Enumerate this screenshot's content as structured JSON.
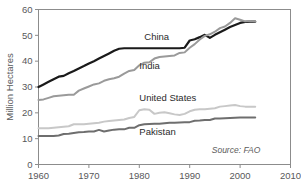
{
  "chart_data": {
    "type": "line",
    "title": "",
    "subtitle": "",
    "xlabel": "",
    "ylabel": "Million Hectares",
    "xlim": [
      1960,
      2010
    ],
    "ylim": [
      0,
      60
    ],
    "xticks": [
      1960,
      1970,
      1980,
      1990,
      2000,
      2010
    ],
    "xticklabels": [
      "1960",
      "1970",
      "1980",
      "1990",
      "2000",
      "2010"
    ],
    "yticks": [
      0,
      10,
      20,
      30,
      40,
      50,
      60
    ],
    "yticklabels": [
      "0",
      "10",
      "20",
      "30",
      "40",
      "50",
      "60"
    ],
    "grid": false,
    "legend_position": "inline-labels",
    "annotations": [
      {
        "name": "source",
        "text": "Source: FAO",
        "x": 2004,
        "y": 4.4
      }
    ],
    "series": [
      {
        "name": "China",
        "label": "China",
        "color": "#1a1a1a",
        "width": 2.2,
        "label_x": 1981,
        "label_y": 48.2,
        "x": [
          1960,
          1961,
          1962,
          1963,
          1964,
          1965,
          1966,
          1967,
          1968,
          1969,
          1970,
          1971,
          1972,
          1973,
          1974,
          1975,
          1976,
          1977,
          1978,
          1979,
          1980,
          1981,
          1982,
          1983,
          1984,
          1985,
          1986,
          1987,
          1988,
          1989,
          1990,
          1991,
          1992,
          1993,
          1994,
          1995,
          1996,
          1997,
          1998,
          1999,
          2000,
          2001,
          2002,
          2003
        ],
        "y": [
          30.0,
          31.0,
          32.0,
          33.0,
          34.0,
          34.3,
          35.3,
          36.2,
          37.2,
          38.1,
          39.1,
          40.0,
          41.0,
          42.0,
          43.0,
          44.0,
          44.8,
          45.0,
          45.0,
          45.0,
          45.0,
          45.0,
          45.0,
          45.0,
          45.0,
          45.0,
          45.0,
          45.0,
          45.0,
          45.2,
          48.0,
          48.5,
          49.3,
          50.2,
          49.0,
          50.2,
          51.2,
          52.2,
          53.2,
          54.0,
          54.8,
          55.2,
          55.3,
          55.3
        ]
      },
      {
        "name": "India",
        "label": "India",
        "color": "#9a9a9a",
        "width": 2.0,
        "label_x": 1980,
        "label_y": 37.0,
        "x": [
          1960,
          1961,
          1962,
          1963,
          1964,
          1965,
          1966,
          1967,
          1968,
          1969,
          1970,
          1971,
          1972,
          1973,
          1974,
          1975,
          1976,
          1977,
          1978,
          1979,
          1980,
          1981,
          1982,
          1983,
          1984,
          1985,
          1986,
          1987,
          1988,
          1989,
          1990,
          1991,
          1992,
          1993,
          1994,
          1995,
          1996,
          1997,
          1998,
          1999,
          2000,
          2001,
          2002,
          2003
        ],
        "y": [
          25.0,
          25.2,
          25.8,
          26.4,
          26.6,
          26.8,
          27.0,
          27.0,
          28.6,
          29.4,
          30.2,
          31.0,
          31.4,
          32.4,
          33.0,
          33.4,
          34.0,
          35.2,
          36.2,
          36.6,
          38.4,
          39.4,
          39.6,
          41.0,
          41.6,
          41.8,
          42.0,
          42.2,
          43.2,
          43.4,
          45.2,
          46.6,
          48.4,
          49.8,
          50.4,
          51.4,
          52.8,
          53.4,
          54.8,
          56.6,
          56.0,
          55.4,
          55.6,
          55.4
        ]
      },
      {
        "name": "United States",
        "label": "United States",
        "color": "#c8c8c8",
        "width": 2.0,
        "label_x": 1980,
        "label_y": 24.6,
        "x": [
          1960,
          1961,
          1962,
          1963,
          1964,
          1965,
          1966,
          1967,
          1968,
          1969,
          1970,
          1971,
          1972,
          1973,
          1974,
          1975,
          1976,
          1977,
          1978,
          1979,
          1980,
          1981,
          1982,
          1983,
          1984,
          1985,
          1986,
          1987,
          1988,
          1989,
          1990,
          1991,
          1992,
          1993,
          1994,
          1995,
          1996,
          1997,
          1998,
          1999,
          2000,
          2001,
          2002,
          2003
        ],
        "y": [
          14.0,
          14.0,
          14.0,
          14.2,
          14.4,
          14.6,
          14.8,
          15.6,
          15.6,
          15.6,
          15.8,
          16.0,
          16.2,
          16.6,
          16.8,
          17.0,
          17.2,
          17.4,
          18.0,
          18.4,
          21.0,
          21.4,
          21.2,
          19.6,
          20.0,
          20.2,
          19.8,
          19.4,
          19.2,
          19.6,
          20.6,
          21.2,
          21.4,
          21.4,
          21.6,
          21.8,
          22.4,
          22.6,
          22.8,
          23.0,
          22.6,
          22.4,
          22.4,
          22.4
        ]
      },
      {
        "name": "Pakistan",
        "label": "Pakistan",
        "color": "#6e6e6e",
        "width": 2.0,
        "label_x": 1980,
        "label_y": 11.6,
        "x": [
          1960,
          1961,
          1962,
          1963,
          1964,
          1965,
          1966,
          1967,
          1968,
          1969,
          1970,
          1971,
          1972,
          1973,
          1974,
          1975,
          1976,
          1977,
          1978,
          1979,
          1980,
          1981,
          1982,
          1983,
          1984,
          1985,
          1986,
          1987,
          1988,
          1989,
          1990,
          1991,
          1992,
          1993,
          1994,
          1995,
          1996,
          1997,
          1998,
          1999,
          2000,
          2001,
          2002,
          2003
        ],
        "y": [
          11.0,
          11.0,
          11.0,
          11.0,
          11.2,
          11.8,
          11.9,
          12.2,
          12.5,
          12.6,
          12.8,
          12.8,
          13.4,
          12.8,
          13.2,
          13.5,
          13.6,
          13.6,
          14.2,
          14.2,
          15.2,
          15.6,
          15.7,
          15.8,
          15.8,
          16.0,
          16.2,
          16.2,
          16.3,
          16.4,
          16.4,
          16.9,
          17.0,
          17.2,
          17.2,
          17.8,
          17.8,
          17.9,
          18.0,
          18.1,
          18.2,
          18.2,
          18.2,
          18.2
        ]
      }
    ]
  },
  "colors": {
    "frame": "#8c8c8c",
    "text": "#58585a",
    "background": "#ffffff"
  }
}
